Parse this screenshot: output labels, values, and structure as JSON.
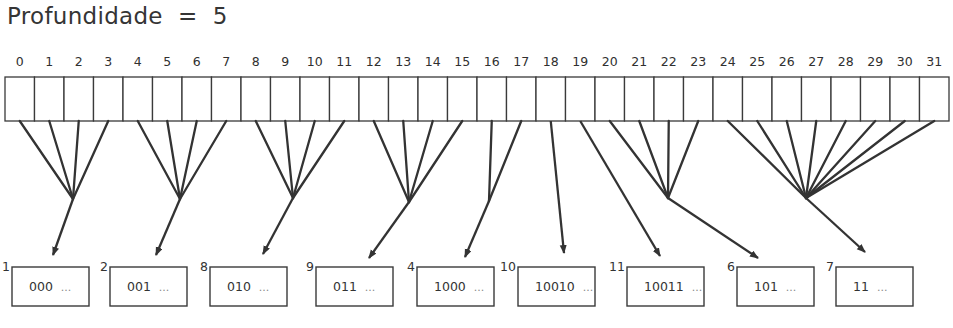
{
  "title": "Profundidade  =  5",
  "global_depth": 5,
  "directory": {
    "num_cells": 32,
    "x0": 5,
    "x1": 949,
    "top": 77,
    "bottom": 121,
    "index_labels": [
      "0",
      "1",
      "2",
      "3",
      "4",
      "5",
      "6",
      "7",
      "8",
      "9",
      "10",
      "11",
      "12",
      "13",
      "14",
      "15",
      "16",
      "17",
      "18",
      "19",
      "20",
      "21",
      "22",
      "23",
      "24",
      "25",
      "26",
      "27",
      "28",
      "29",
      "30",
      "31"
    ]
  },
  "buckets": [
    {
      "local_depth": "1",
      "prefix": "000",
      "ellipsis": "...",
      "x": 12,
      "cells": [
        0,
        1,
        2,
        3
      ],
      "join": [
        73,
        199
      ],
      "tip": [
        53,
        255
      ]
    },
    {
      "local_depth": "2",
      "prefix": "001",
      "ellipsis": "...",
      "x": 110,
      "cells": [
        4,
        5,
        6,
        7
      ],
      "join": [
        180,
        199
      ],
      "tip": [
        156,
        255
      ]
    },
    {
      "local_depth": "8",
      "prefix": "010",
      "ellipsis": "...",
      "x": 210,
      "cells": [
        8,
        9,
        10,
        11
      ],
      "join": [
        293,
        198
      ],
      "tip": [
        263,
        254
      ]
    },
    {
      "local_depth": "9",
      "prefix": "011",
      "ellipsis": "...",
      "x": 316,
      "cells": [
        12,
        13,
        14,
        15
      ],
      "join": [
        409,
        202
      ],
      "tip": [
        369,
        258
      ]
    },
    {
      "local_depth": "4",
      "prefix": "1000",
      "ellipsis": "...",
      "x": 417,
      "cells": [
        16,
        17
      ],
      "join": [
        489,
        201
      ],
      "tip": [
        465,
        257
      ]
    },
    {
      "local_depth": "10",
      "prefix": "10010",
      "ellipsis": "...",
      "x": 518,
      "cells": [
        18
      ],
      "join": null,
      "tip": [
        564,
        253
      ]
    },
    {
      "local_depth": "11",
      "prefix": "10011",
      "ellipsis": "...",
      "x": 627,
      "cells": [
        19
      ],
      "join": null,
      "tip": [
        660,
        256
      ]
    },
    {
      "local_depth": "6",
      "prefix": "101",
      "ellipsis": "...",
      "x": 737,
      "cells": [
        20,
        21,
        22,
        23
      ],
      "join": [
        668,
        198
      ],
      "tip": [
        758,
        258
      ]
    },
    {
      "local_depth": "7",
      "prefix": "11",
      "ellipsis": "...",
      "x": 836,
      "cells": [
        24,
        25,
        26,
        27,
        28,
        29,
        30,
        31
      ],
      "join": [
        806,
        198
      ],
      "tip": [
        865,
        252
      ]
    }
  ],
  "bucket_box": {
    "width": 77,
    "top": 267,
    "height": 39
  },
  "colors": {
    "line": "#333333",
    "text": "#303030",
    "background": "#ffffff"
  }
}
